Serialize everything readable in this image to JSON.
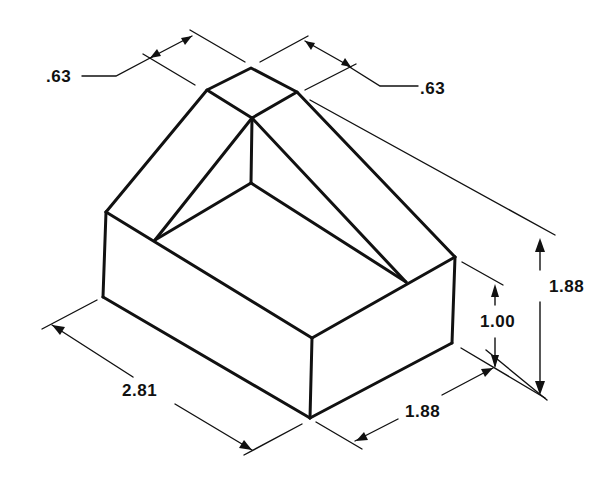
{
  "figure": {
    "type": "isometric-technical-drawing",
    "line_color": "#111111",
    "background": "#ffffff"
  },
  "dimensions": {
    "top_width_left": ".63",
    "top_width_right": ".63",
    "length": "2.81",
    "depth": "1.88",
    "base_height": "1.00",
    "overall_height": "1.88"
  }
}
